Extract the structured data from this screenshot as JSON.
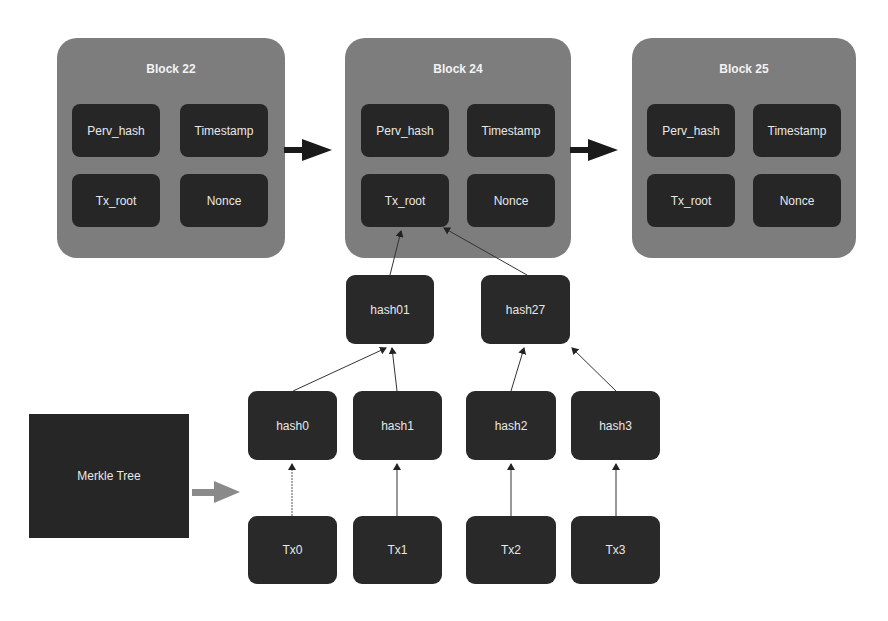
{
  "blocks": [
    {
      "title": "Block 22",
      "fields": {
        "prev_hash": "Perv_hash",
        "timestamp": "Timestamp",
        "tx_root": "Tx_root",
        "nonce": "Nonce"
      }
    },
    {
      "title": "Block 24",
      "fields": {
        "prev_hash": "Perv_hash",
        "timestamp": "Timestamp",
        "tx_root": "Tx_root",
        "nonce": "Nonce"
      }
    },
    {
      "title": "Block 25",
      "fields": {
        "prev_hash": "Perv_hash",
        "timestamp": "Timestamp",
        "tx_root": "Tx_root",
        "nonce": "Nonce"
      }
    }
  ],
  "merkle_tree": {
    "label": "Merkle Tree",
    "level1": [
      "hash01",
      "hash27"
    ],
    "level2": [
      "hash0",
      "hash1",
      "hash2",
      "hash3"
    ],
    "transactions": [
      "Tx0",
      "Tx1",
      "Tx2",
      "Tx3"
    ]
  },
  "colors": {
    "block_bg": "#7d7d7d",
    "node_bg": "#292929",
    "text": "#e8e8e8",
    "chain_arrow": "#1a1a1a",
    "merkle_arrow": "#8a8a8a"
  }
}
